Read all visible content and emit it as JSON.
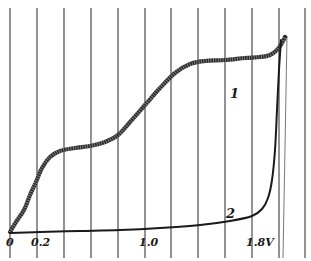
{
  "chart_data": {
    "type": "line",
    "title": "",
    "xlabel": "V",
    "ylabel": "",
    "x_tick_labels": [
      {
        "label": "0",
        "x_px": 10
      },
      {
        "label": "0.2",
        "x_px": 37
      },
      {
        "label": "1.0",
        "x_px": 145
      },
      {
        "label": "1.8V",
        "x_px": 252
      }
    ],
    "xlim": [
      0,
      2.0
    ],
    "grid": {
      "vertical_lines_px": [
        10,
        37,
        64,
        91,
        118,
        145,
        171,
        198,
        225,
        252,
        279,
        305
      ],
      "horizontal": false
    },
    "series": [
      {
        "name": "1",
        "style": "thick hatched",
        "points_px": [
          [
            10,
            232
          ],
          [
            16,
            222
          ],
          [
            24,
            210
          ],
          [
            30,
            195
          ],
          [
            36,
            182
          ],
          [
            42,
            168
          ],
          [
            50,
            157
          ],
          [
            60,
            151
          ],
          [
            75,
            148
          ],
          [
            90,
            146
          ],
          [
            105,
            142
          ],
          [
            118,
            135
          ],
          [
            130,
            122
          ],
          [
            145,
            105
          ],
          [
            160,
            88
          ],
          [
            175,
            73
          ],
          [
            190,
            64
          ],
          [
            205,
            61
          ],
          [
            225,
            60
          ],
          [
            245,
            58
          ],
          [
            260,
            57
          ],
          [
            270,
            55
          ],
          [
            277,
            50
          ],
          [
            282,
            43
          ],
          [
            285,
            37
          ]
        ],
        "label_pos_px": [
          230,
          98
        ]
      },
      {
        "name": "2",
        "style": "thin solid",
        "points_px": [
          [
            10,
            233
          ],
          [
            40,
            232
          ],
          [
            80,
            231
          ],
          [
            120,
            230
          ],
          [
            160,
            228
          ],
          [
            200,
            225
          ],
          [
            230,
            221
          ],
          [
            252,
            216
          ],
          [
            262,
            209
          ],
          [
            268,
            198
          ],
          [
            272,
            180
          ],
          [
            275,
            150
          ],
          [
            277,
            110
          ],
          [
            279,
            70
          ],
          [
            281,
            40
          ]
        ],
        "label_pos_px": [
          226,
          218
        ]
      }
    ],
    "legend": null,
    "annotations": [
      "1",
      "2"
    ]
  }
}
